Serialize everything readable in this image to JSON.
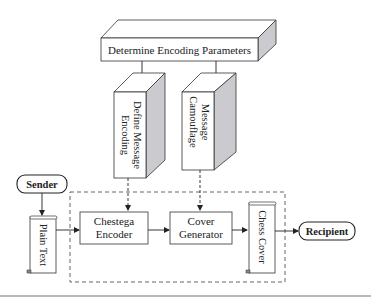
{
  "diagram": {
    "nodes": {
      "determine_params": {
        "label": "Determine Encoding Parameters",
        "shape": "3d-box"
      },
      "define_encoding": {
        "label_line1": "Define Message",
        "label_line2": "Encoding",
        "shape": "3d-box-vertical"
      },
      "camouflage": {
        "label_line1": "Message",
        "label_line2": "Camouflage",
        "shape": "3d-box-vertical"
      },
      "sender": {
        "label": "Sender",
        "shape": "terminator"
      },
      "plain_text": {
        "label": "Plain Text",
        "shape": "scroll"
      },
      "chestega_encoder": {
        "label_line1": "Chestega",
        "label_line2": "Encoder",
        "shape": "rectangle"
      },
      "cover_generator": {
        "label_line1": "Cover",
        "label_line2": "Generator",
        "shape": "rectangle"
      },
      "chess_cover": {
        "label": "Chess Cover",
        "shape": "scroll"
      },
      "recipient": {
        "label": "Recipient",
        "shape": "terminator"
      }
    },
    "edges": [
      {
        "from": "Determine Encoding Parameters",
        "to": "Define Message Encoding",
        "style": "solid"
      },
      {
        "from": "Determine Encoding Parameters",
        "to": "Message Camouflage",
        "style": "solid"
      },
      {
        "from": "Define Message Encoding",
        "to": "Chestega Encoder",
        "style": "dashed"
      },
      {
        "from": "Message Camouflage",
        "to": "Cover Generator",
        "style": "dashed"
      },
      {
        "from": "Sender",
        "to": "Plain Text",
        "style": "solid"
      },
      {
        "from": "Plain Text",
        "to": "Chestega Encoder",
        "style": "solid"
      },
      {
        "from": "Chestega Encoder",
        "to": "Cover Generator",
        "style": "solid"
      },
      {
        "from": "Cover Generator",
        "to": "Chess Cover",
        "style": "solid"
      },
      {
        "from": "Chess Cover",
        "to": "Recipient",
        "style": "solid"
      }
    ],
    "group": {
      "style": "dashed",
      "contains": [
        "Chestega Encoder",
        "Cover Generator",
        "Chess Cover"
      ]
    },
    "colors": {
      "line": "#2a2a2a",
      "side_face": "#c9c9cc",
      "face": "#ffffff",
      "dash": "#555555"
    }
  }
}
